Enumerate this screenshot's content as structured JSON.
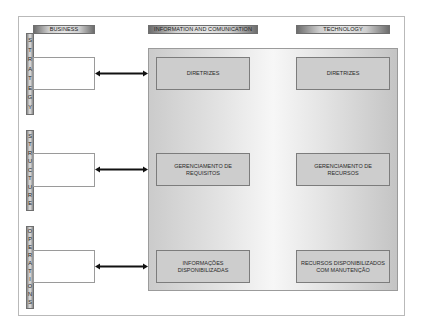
{
  "headers": {
    "business": "BUSINESS",
    "info": "INFORMATION AND COMUNICATION",
    "technology": "TECHNOLOGY"
  },
  "rows": [
    {
      "label": "STRATEGY",
      "letters": [
        "S",
        "T",
        "R",
        "A",
        "T",
        "E",
        "G",
        "Y"
      ],
      "info_box": "DIRETRIZES",
      "tech_box": "DIRETRIZES"
    },
    {
      "label": "STRUCTURE",
      "letters": [
        "S",
        "T",
        "R",
        "U",
        "C",
        "T",
        "U",
        "R",
        "E"
      ],
      "info_box": "GERENCIAMENTO DE REQUISITOS",
      "tech_box": "GERENCIAMENTO DE RECURSOS"
    },
    {
      "label": "OPERATIONS",
      "letters": [
        "O",
        "P",
        "E",
        "R",
        "A",
        "T",
        "I",
        "O",
        "N",
        "S"
      ],
      "info_box": "INFORMAÇÕES DISPONIBILIZADAS",
      "tech_box": "RECURSOS DISPONIBILIZADOS COM MANUTENÇÃO"
    }
  ],
  "connectors": [
    "bidirectional-arrow",
    "bidirectional-arrow",
    "bidirectional-arrow"
  ]
}
